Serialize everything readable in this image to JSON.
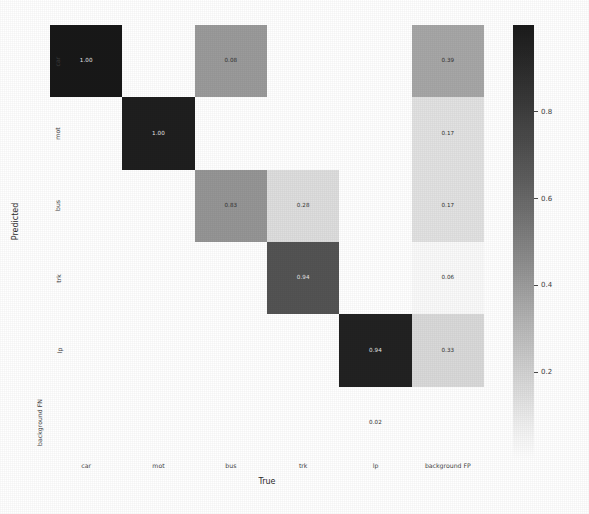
{
  "chart_data": {
    "type": "heatmap",
    "title": "",
    "xlabel": "True",
    "ylabel": "Predicted",
    "x_categories": [
      "car",
      "mot",
      "bus",
      "trk",
      "lp",
      "background FP"
    ],
    "y_categories": [
      "car",
      "mot",
      "bus",
      "trk",
      "lp",
      "background FN"
    ],
    "colormap": "grayscale_reversed",
    "colorbar": {
      "ticks": [
        "0.2",
        "0.4",
        "0.6",
        "0.8"
      ],
      "tick_values": [
        0.2,
        0.4,
        0.6,
        0.8
      ],
      "vmin": 0.0,
      "vmax": 1.0,
      "position": "right"
    },
    "grid": false,
    "cells": [
      [
        {
          "value": 1.0,
          "label": "1.00",
          "shade": 0.97,
          "visible": true
        },
        {
          "value": null,
          "label": "",
          "shade": 0.0,
          "visible": false
        },
        {
          "value": 0.08,
          "label": "0.08",
          "shade": 0.42,
          "visible": true
        },
        {
          "value": null,
          "label": "",
          "shade": 0.0,
          "visible": false
        },
        {
          "value": null,
          "label": "",
          "shade": 0.0,
          "visible": false
        },
        {
          "value": 0.39,
          "label": "0.39",
          "shade": 0.37,
          "visible": true
        }
      ],
      [
        {
          "value": null,
          "label": "",
          "shade": 0.0,
          "visible": false
        },
        {
          "value": 1.0,
          "label": "1.00",
          "shade": 0.94,
          "visible": true
        },
        {
          "value": null,
          "label": "",
          "shade": 0.0,
          "visible": false
        },
        {
          "value": null,
          "label": "",
          "shade": 0.0,
          "visible": false
        },
        {
          "value": null,
          "label": "",
          "shade": 0.0,
          "visible": false
        },
        {
          "value": 0.17,
          "label": "0.17",
          "shade": 0.12,
          "visible": true
        }
      ],
      [
        {
          "value": null,
          "label": "",
          "shade": 0.0,
          "visible": false
        },
        {
          "value": null,
          "label": "",
          "shade": 0.0,
          "visible": false
        },
        {
          "value": 0.83,
          "label": "0.83",
          "shade": 0.44,
          "visible": true
        },
        {
          "value": 0.28,
          "label": "0.28",
          "shade": 0.14,
          "visible": true
        },
        {
          "value": null,
          "label": "",
          "shade": 0.0,
          "visible": false
        },
        {
          "value": 0.17,
          "label": "0.17",
          "shade": 0.12,
          "visible": true
        }
      ],
      [
        {
          "value": null,
          "label": "",
          "shade": 0.0,
          "visible": false
        },
        {
          "value": null,
          "label": "",
          "shade": 0.0,
          "visible": false
        },
        {
          "value": null,
          "label": "",
          "shade": 0.0,
          "visible": false
        },
        {
          "value": 0.94,
          "label": "0.94",
          "shade": 0.72,
          "visible": true
        },
        {
          "value": null,
          "label": "",
          "shade": 0.0,
          "visible": false
        },
        {
          "value": 0.06,
          "label": "0.06",
          "shade": 0.02,
          "visible": true
        }
      ],
      [
        {
          "value": null,
          "label": "",
          "shade": 0.0,
          "visible": false
        },
        {
          "value": null,
          "label": "",
          "shade": 0.0,
          "visible": false
        },
        {
          "value": null,
          "label": "",
          "shade": 0.0,
          "visible": false
        },
        {
          "value": null,
          "label": "",
          "shade": 0.0,
          "visible": false
        },
        {
          "value": 0.94,
          "label": "0.94",
          "shade": 0.93,
          "visible": true
        },
        {
          "value": 0.33,
          "label": "0.33",
          "shade": 0.16,
          "visible": true
        }
      ],
      [
        {
          "value": null,
          "label": "",
          "shade": 0.0,
          "visible": false
        },
        {
          "value": null,
          "label": "",
          "shade": 0.0,
          "visible": false
        },
        {
          "value": null,
          "label": "",
          "shade": 0.0,
          "visible": false
        },
        {
          "value": null,
          "label": "",
          "shade": 0.0,
          "visible": false
        },
        {
          "value": 0.02,
          "label": "0.02",
          "shade": 0.0,
          "visible": true
        },
        {
          "value": null,
          "label": "",
          "shade": 0.0,
          "visible": false
        }
      ]
    ]
  }
}
